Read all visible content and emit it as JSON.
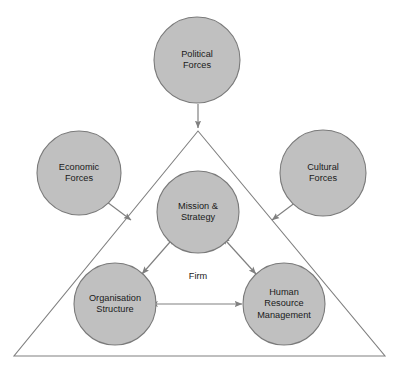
{
  "diagram": {
    "background_color": "#ffffff",
    "circle_fill": "#c0c0c0",
    "circle_stroke": "#7a7a7a",
    "triangle_stroke": "#808080",
    "arrow_color": "#808080",
    "text_color": "#1a1a1a",
    "container_label": "Firm",
    "external_nodes": [
      {
        "id": "political-forces",
        "label": "Political\nForces",
        "cx": 197,
        "cy": 60,
        "r": 43
      },
      {
        "id": "economic-forces",
        "label": "Economic\nForces",
        "cx": 79,
        "cy": 173,
        "r": 42
      },
      {
        "id": "cultural-forces",
        "label": "Cultural\nForces",
        "cx": 323,
        "cy": 173,
        "r": 43
      }
    ],
    "internal_nodes": [
      {
        "id": "mission-strategy",
        "label": "Mission &\nStrategy",
        "cx": 198,
        "cy": 212,
        "r": 41
      },
      {
        "id": "organisation-structure",
        "label": "Organisation\nStructure",
        "cx": 115,
        "cy": 304,
        "r": 41
      },
      {
        "id": "human-resource-management",
        "label": "Human\nResource\nManagement",
        "cx": 284,
        "cy": 304,
        "r": 41
      }
    ],
    "triangle": {
      "apex_x": 198,
      "apex_y": 131,
      "left_x": 14,
      "right_x": 385,
      "base_y": 356
    },
    "connections": [
      {
        "id": "political-to-firm",
        "from": "political-forces",
        "to": "triangle-apex",
        "arrows": "single"
      },
      {
        "id": "economic-to-firm",
        "from": "economic-forces",
        "to": "triangle-left-edge",
        "arrows": "single"
      },
      {
        "id": "cultural-to-firm",
        "from": "cultural-forces",
        "to": "triangle-right-edge",
        "arrows": "single"
      },
      {
        "id": "mission-organisation",
        "from": "mission-strategy",
        "to": "organisation-structure",
        "arrows": "double"
      },
      {
        "id": "mission-hrm",
        "from": "mission-strategy",
        "to": "human-resource-management",
        "arrows": "double"
      },
      {
        "id": "organisation-hrm",
        "from": "organisation-structure",
        "to": "human-resource-management",
        "arrows": "double"
      }
    ]
  }
}
